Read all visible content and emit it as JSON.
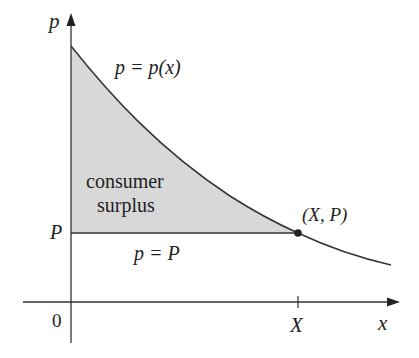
{
  "diagram": {
    "type": "consumer-surplus-graph",
    "axes": {
      "y_label": "p",
      "x_label": "x",
      "origin_label": "0"
    },
    "curve_label": "p = p(x)",
    "price_line_label": "p = P",
    "region_label_line1": "consumer",
    "region_label_line2": "surplus",
    "point_label": "(X, P)",
    "y_tick_label": "P",
    "x_tick_label": "X",
    "colors": {
      "fill": "#d8d8d8",
      "stroke": "#333333",
      "text": "#222222"
    }
  }
}
